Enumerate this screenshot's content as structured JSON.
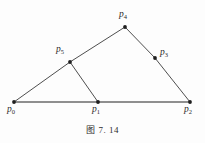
{
  "figure": {
    "caption": "图 7. 14",
    "background_color": "#fdfdfd",
    "stroke_color": "#3a3a3a",
    "base_stroke_color": "#6b6b6b",
    "label_color": "#2b2b2b"
  },
  "points": [
    {
      "id": "p0",
      "letter": "p",
      "sub": "0",
      "x": 14,
      "y": 102,
      "label_x": 7,
      "label_y": 105
    },
    {
      "id": "p1",
      "letter": "p",
      "sub": "1",
      "x": 98,
      "y": 102,
      "label_x": 92,
      "label_y": 105
    },
    {
      "id": "p2",
      "letter": "p",
      "sub": "2",
      "x": 190,
      "y": 102,
      "label_x": 184,
      "label_y": 105
    },
    {
      "id": "p3",
      "letter": "p",
      "sub": "3",
      "x": 155,
      "y": 58,
      "label_x": 160,
      "label_y": 48
    },
    {
      "id": "p4",
      "letter": "p",
      "sub": "4",
      "x": 125,
      "y": 27,
      "label_x": 119,
      "label_y": 10
    },
    {
      "id": "p5",
      "letter": "p",
      "sub": "5",
      "x": 70,
      "y": 62,
      "label_x": 56,
      "label_y": 45
    }
  ],
  "segments": [
    {
      "id": "seg-p0-p5",
      "from": "p0",
      "to": "p5",
      "x1": 14,
      "y1": 102,
      "x2": 70,
      "y2": 62,
      "weight": "thin"
    },
    {
      "id": "seg-p5-p4",
      "from": "p5",
      "to": "p4",
      "x1": 70,
      "y1": 62,
      "x2": 125,
      "y2": 27,
      "weight": "thin"
    },
    {
      "id": "seg-p4-p3",
      "from": "p4",
      "to": "p3",
      "x1": 125,
      "y1": 27,
      "x2": 155,
      "y2": 58,
      "weight": "thin"
    },
    {
      "id": "seg-p3-p2",
      "from": "p3",
      "to": "p2",
      "x1": 155,
      "y1": 58,
      "x2": 190,
      "y2": 102,
      "weight": "thin"
    },
    {
      "id": "seg-p5-p1",
      "from": "p5",
      "to": "p1",
      "x1": 70,
      "y1": 62,
      "x2": 98,
      "y2": 102,
      "weight": "thin"
    },
    {
      "id": "seg-p0-p2",
      "from": "p0",
      "to": "p2",
      "x1": 14,
      "y1": 102,
      "x2": 190,
      "y2": 102,
      "weight": "base"
    }
  ],
  "chart_data": {
    "type": "diagram",
    "title": "图 7. 14",
    "nodes": [
      {
        "name": "p0",
        "x": 14,
        "y": 102
      },
      {
        "name": "p1",
        "x": 98,
        "y": 102
      },
      {
        "name": "p2",
        "x": 190,
        "y": 102
      },
      {
        "name": "p3",
        "x": 155,
        "y": 58
      },
      {
        "name": "p4",
        "x": 125,
        "y": 27
      },
      {
        "name": "p5",
        "x": 70,
        "y": 62
      }
    ],
    "edges": [
      [
        "p0",
        "p5"
      ],
      [
        "p5",
        "p4"
      ],
      [
        "p4",
        "p3"
      ],
      [
        "p3",
        "p2"
      ],
      [
        "p5",
        "p1"
      ],
      [
        "p0",
        "p2"
      ]
    ]
  }
}
